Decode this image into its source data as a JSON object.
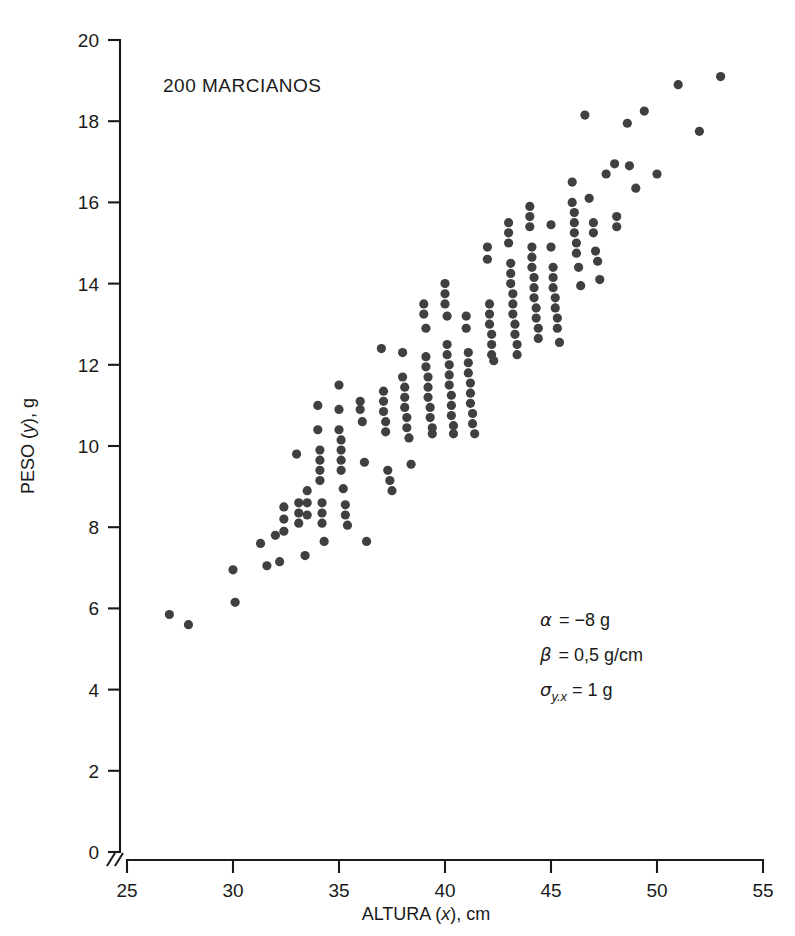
{
  "figure": {
    "caption": "200 MARCIANOS",
    "background_color": "#ffffff",
    "point_color": "#404040",
    "axis_color": "#1a1a1a"
  },
  "annotations": {
    "alpha_label": "α",
    "alpha_value": "= −8 g",
    "beta_label": "β",
    "beta_value": "= 0,5 g/cm",
    "sigma_label": "σ",
    "sigma_sub": "y.x",
    "sigma_value": "= 1 g"
  },
  "chart_data": {
    "type": "scatter",
    "title": "200 MARCIANOS",
    "xlabel": "ALTURA (x), cm",
    "ylabel": "PESO (y), g",
    "xlim": [
      25,
      55
    ],
    "ylim": [
      0,
      20
    ],
    "xticks": [
      25,
      30,
      35,
      40,
      45,
      50,
      55
    ],
    "yticks": [
      0,
      2,
      4,
      6,
      8,
      10,
      12,
      14,
      16,
      18,
      20
    ],
    "x_axis_break": true,
    "grid": false,
    "legend": null,
    "n_points": 200,
    "model": {
      "intercept_alpha": -8,
      "slope_beta": 0.5,
      "sigma_y_given_x": 1,
      "units": {
        "alpha": "g",
        "beta": "g/cm",
        "sigma": "g"
      }
    },
    "points": [
      [
        27.0,
        5.85
      ],
      [
        27.9,
        5.6
      ],
      [
        30.0,
        6.95
      ],
      [
        30.1,
        6.15
      ],
      [
        31.3,
        7.6
      ],
      [
        31.6,
        7.05
      ],
      [
        32.0,
        7.8
      ],
      [
        32.2,
        7.15
      ],
      [
        32.4,
        8.5
      ],
      [
        32.4,
        8.2
      ],
      [
        32.4,
        7.9
      ],
      [
        33.0,
        9.8
      ],
      [
        33.1,
        8.6
      ],
      [
        33.1,
        8.35
      ],
      [
        33.1,
        8.1
      ],
      [
        33.4,
        7.3
      ],
      [
        33.5,
        8.9
      ],
      [
        33.5,
        8.6
      ],
      [
        33.5,
        8.3
      ],
      [
        34.0,
        10.4
      ],
      [
        34.0,
        11.0
      ],
      [
        34.1,
        9.9
      ],
      [
        34.1,
        9.65
      ],
      [
        34.1,
        9.4
      ],
      [
        34.1,
        9.15
      ],
      [
        34.2,
        8.6
      ],
      [
        34.2,
        8.35
      ],
      [
        34.2,
        8.1
      ],
      [
        34.3,
        7.65
      ],
      [
        35.0,
        11.5
      ],
      [
        35.0,
        10.9
      ],
      [
        35.0,
        10.4
      ],
      [
        35.1,
        10.15
      ],
      [
        35.1,
        9.9
      ],
      [
        35.1,
        9.65
      ],
      [
        35.1,
        9.4
      ],
      [
        35.2,
        8.95
      ],
      [
        35.3,
        8.55
      ],
      [
        35.3,
        8.3
      ],
      [
        35.4,
        8.05
      ],
      [
        36.0,
        11.1
      ],
      [
        36.0,
        10.9
      ],
      [
        36.1,
        10.6
      ],
      [
        36.2,
        9.6
      ],
      [
        36.3,
        7.65
      ],
      [
        37.0,
        12.4
      ],
      [
        37.1,
        11.35
      ],
      [
        37.1,
        11.1
      ],
      [
        37.1,
        10.85
      ],
      [
        37.2,
        10.6
      ],
      [
        37.2,
        10.35
      ],
      [
        37.3,
        9.4
      ],
      [
        37.4,
        9.15
      ],
      [
        37.5,
        8.9
      ],
      [
        38.0,
        12.3
      ],
      [
        38.0,
        11.7
      ],
      [
        38.1,
        11.45
      ],
      [
        38.1,
        11.2
      ],
      [
        38.1,
        10.95
      ],
      [
        38.2,
        10.7
      ],
      [
        38.2,
        10.45
      ],
      [
        38.3,
        10.2
      ],
      [
        38.4,
        9.55
      ],
      [
        39.0,
        13.5
      ],
      [
        39.0,
        13.25
      ],
      [
        39.1,
        12.9
      ],
      [
        39.1,
        12.2
      ],
      [
        39.1,
        11.95
      ],
      [
        39.2,
        11.7
      ],
      [
        39.2,
        11.45
      ],
      [
        39.2,
        11.2
      ],
      [
        39.3,
        10.95
      ],
      [
        39.3,
        10.7
      ],
      [
        39.4,
        10.45
      ],
      [
        39.4,
        10.3
      ],
      [
        40.0,
        14.0
      ],
      [
        40.0,
        13.75
      ],
      [
        40.0,
        13.5
      ],
      [
        40.1,
        13.2
      ],
      [
        40.1,
        12.5
      ],
      [
        40.1,
        12.25
      ],
      [
        40.2,
        12.0
      ],
      [
        40.2,
        11.75
      ],
      [
        40.2,
        11.5
      ],
      [
        40.3,
        11.25
      ],
      [
        40.3,
        11.0
      ],
      [
        40.3,
        10.75
      ],
      [
        40.4,
        10.5
      ],
      [
        40.4,
        10.3
      ],
      [
        41.0,
        13.2
      ],
      [
        41.0,
        12.9
      ],
      [
        41.1,
        12.3
      ],
      [
        41.1,
        12.05
      ],
      [
        41.1,
        11.8
      ],
      [
        41.2,
        11.55
      ],
      [
        41.2,
        11.3
      ],
      [
        41.2,
        11.05
      ],
      [
        41.3,
        10.8
      ],
      [
        41.3,
        10.55
      ],
      [
        41.4,
        10.3
      ],
      [
        42.0,
        14.9
      ],
      [
        42.0,
        14.6
      ],
      [
        42.1,
        13.5
      ],
      [
        42.1,
        13.25
      ],
      [
        42.1,
        13.0
      ],
      [
        42.2,
        12.75
      ],
      [
        42.2,
        12.5
      ],
      [
        42.2,
        12.25
      ],
      [
        42.3,
        12.1
      ],
      [
        43.0,
        15.5
      ],
      [
        43.0,
        15.25
      ],
      [
        43.0,
        15.0
      ],
      [
        43.1,
        14.5
      ],
      [
        43.1,
        14.25
      ],
      [
        43.1,
        14.0
      ],
      [
        43.2,
        13.75
      ],
      [
        43.2,
        13.5
      ],
      [
        43.2,
        13.25
      ],
      [
        43.3,
        13.0
      ],
      [
        43.3,
        12.75
      ],
      [
        43.4,
        12.5
      ],
      [
        43.4,
        12.25
      ],
      [
        44.0,
        15.9
      ],
      [
        44.0,
        15.65
      ],
      [
        44.0,
        15.4
      ],
      [
        44.1,
        14.9
      ],
      [
        44.1,
        14.65
      ],
      [
        44.1,
        14.4
      ],
      [
        44.2,
        14.15
      ],
      [
        44.2,
        13.9
      ],
      [
        44.2,
        13.65
      ],
      [
        44.3,
        13.4
      ],
      [
        44.3,
        13.15
      ],
      [
        44.4,
        12.9
      ],
      [
        44.4,
        12.65
      ],
      [
        45.0,
        15.45
      ],
      [
        45.0,
        14.9
      ],
      [
        45.1,
        14.4
      ],
      [
        45.1,
        14.15
      ],
      [
        45.1,
        13.9
      ],
      [
        45.2,
        13.65
      ],
      [
        45.2,
        13.4
      ],
      [
        45.3,
        13.15
      ],
      [
        45.3,
        12.9
      ],
      [
        45.4,
        12.55
      ],
      [
        46.0,
        16.5
      ],
      [
        46.0,
        16.0
      ],
      [
        46.1,
        15.75
      ],
      [
        46.1,
        15.5
      ],
      [
        46.1,
        15.25
      ],
      [
        46.2,
        15.0
      ],
      [
        46.2,
        14.75
      ],
      [
        46.3,
        14.4
      ],
      [
        46.4,
        13.95
      ],
      [
        46.6,
        18.15
      ],
      [
        46.8,
        16.1
      ],
      [
        47.0,
        15.5
      ],
      [
        47.0,
        15.25
      ],
      [
        47.1,
        14.8
      ],
      [
        47.2,
        14.55
      ],
      [
        47.3,
        14.1
      ],
      [
        47.6,
        16.7
      ],
      [
        48.0,
        16.95
      ],
      [
        48.1,
        15.65
      ],
      [
        48.1,
        15.4
      ],
      [
        48.6,
        17.95
      ],
      [
        48.7,
        16.9
      ],
      [
        49.0,
        16.35
      ],
      [
        49.4,
        18.25
      ],
      [
        50.0,
        16.7
      ],
      [
        51.0,
        18.9
      ],
      [
        52.0,
        17.75
      ],
      [
        53.0,
        19.1
      ]
    ]
  }
}
